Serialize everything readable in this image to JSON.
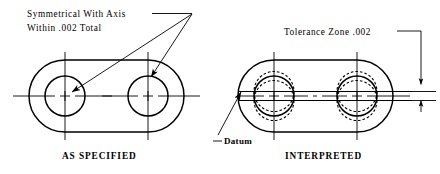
{
  "drawing": {
    "title_implicit": "Symmetry tolerance illustration",
    "background_color": "#ffffff",
    "line_color": "#000000"
  },
  "annotations": {
    "symmetry_note_line1": "Symmetrical With Axis",
    "symmetry_note_line2": "Within .002 Total",
    "tolerance_zone_note": "Tolerance Zone .002",
    "datum_label": "Datum"
  },
  "captions": {
    "left": "AS SPECIFIED",
    "right": "INTERPRETED"
  },
  "left_figure": {
    "name": "as-specified-part",
    "outline_shape": "obround",
    "hole_count": 2,
    "holes": [
      {
        "name": "left-hole",
        "cx": 65,
        "cy": 96,
        "r": 20
      },
      {
        "name": "right-hole",
        "cx": 148,
        "cy": 96,
        "r": 20
      }
    ],
    "leader_count": 2,
    "leader_target_note": "symmetry_note"
  },
  "right_figure": {
    "name": "interpreted-part",
    "outline_shape": "obround",
    "hole_count": 2,
    "holes": [
      {
        "name": "left-hole",
        "cx": 274,
        "cy": 96,
        "r": 20
      },
      {
        "name": "right-hole",
        "cx": 357,
        "cy": 96,
        "r": 20
      }
    ],
    "tolerance_band_width_px": 9,
    "tolerance_value": ".002",
    "datum_leader_target": "left-outline-edge"
  }
}
